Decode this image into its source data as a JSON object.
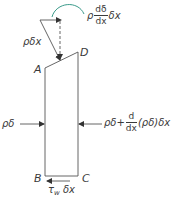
{
  "diagram": {
    "type": "free-body-diagram",
    "colors": {
      "lines": "#555555",
      "text": "#3a3a3a",
      "moment_arrow": "#3a9a8a",
      "background": "#ffffff"
    },
    "points": {
      "A": "A",
      "B": "B",
      "C": "C",
      "D": "D"
    },
    "forces": {
      "weight": {
        "label": "ρδx",
        "direction": "down-right diagonal"
      },
      "weight_component": {
        "prefix": "ρ",
        "frac_num": "dδ",
        "frac_den": "dx",
        "suffix": "δx",
        "arrow": "curved-arc"
      },
      "left_pressure": {
        "label": "ρδ",
        "direction": "right"
      },
      "right_pressure": {
        "prefix": "ρδ+",
        "frac_num": "d",
        "frac_den": "dx",
        "suffix": "(ρδ)δx",
        "direction": "left"
      },
      "wall_shear": {
        "tau": "τ",
        "sub": "w",
        "suffix": " δx",
        "direction": "left"
      }
    }
  }
}
